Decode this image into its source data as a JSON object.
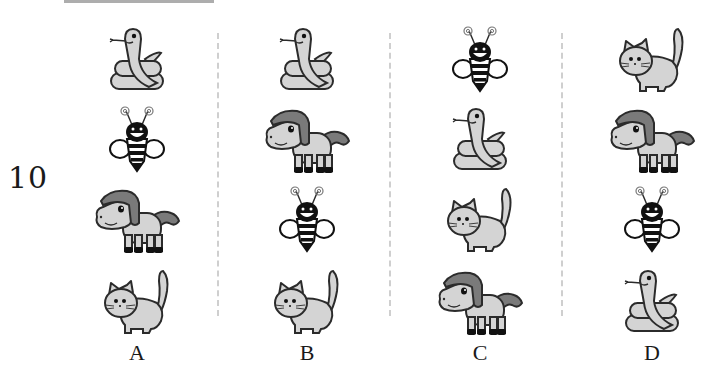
{
  "question": {
    "number": "10"
  },
  "options": [
    {
      "label": "A",
      "animals": [
        "snake",
        "bee",
        "horse",
        "cat"
      ]
    },
    {
      "label": "B",
      "animals": [
        "snake",
        "horse",
        "bee",
        "cat"
      ]
    },
    {
      "label": "C",
      "animals": [
        "bee",
        "snake",
        "cat",
        "horse"
      ]
    },
    {
      "label": "D",
      "animals": [
        "cat",
        "horse",
        "bee",
        "snake"
      ]
    }
  ],
  "colors": {
    "fill_light": "#d4d4d4",
    "fill_mid": "#bdbdbd",
    "mane": "#7a7a7a",
    "outline": "#2b2b2b",
    "divider": "#cfcfcf"
  }
}
